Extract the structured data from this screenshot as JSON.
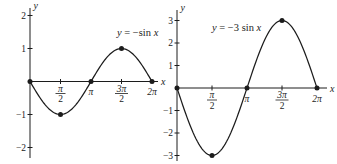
{
  "style": {
    "ink": "#1c1c1c",
    "background": "#ffffff"
  },
  "chart_data": [
    {
      "name": "left-graph",
      "type": "line",
      "title": "y = −sin x",
      "equation_label_segments": [
        {
          "text": "y",
          "italic": true
        },
        {
          "text": " = −sin ",
          "italic": false
        },
        {
          "text": "x",
          "italic": true
        }
      ],
      "amplitude": -1,
      "x_range_radians": [
        0,
        6.28319
      ],
      "ylim": [
        -2,
        2
      ],
      "xlabel": "x",
      "ylabel": "y",
      "grid": false,
      "y_ticks": [
        2,
        1,
        -1,
        -2
      ],
      "x_ticks": [
        {
          "x": 1.5708,
          "label": "π/2",
          "fraction": {
            "num": "π",
            "den": "2"
          },
          "tick_mark": true
        },
        {
          "x": 3.14159,
          "label": "π",
          "tick_mark": false
        },
        {
          "x": 4.71239,
          "label": "3π/2",
          "fraction": {
            "num": "3π",
            "den": "2"
          },
          "tick_mark": true
        },
        {
          "x": 6.28319,
          "label": "2π",
          "tick_mark": false
        }
      ],
      "marked_points": [
        [
          0,
          0
        ],
        [
          1.5708,
          -1
        ],
        [
          3.14159,
          0
        ],
        [
          4.71239,
          1
        ],
        [
          6.28319,
          0
        ]
      ],
      "px": {
        "origin": [
          30,
          81.5
        ],
        "half_pi_px": 30.5,
        "unit_y_px": 33,
        "y_axis_top": 8,
        "y_axis_bottom": 158,
        "x_axis_end": 158,
        "equation_label_pos": [
          117,
          35.5
        ]
      }
    },
    {
      "name": "right-graph",
      "type": "line",
      "title": "y = −3 sin x",
      "equation_label_segments": [
        {
          "text": "y",
          "italic": true
        },
        {
          "text": " = −3 sin ",
          "italic": false
        },
        {
          "text": "x",
          "italic": true
        }
      ],
      "amplitude": -3,
      "x_range_radians": [
        0,
        6.28319
      ],
      "ylim": [
        -3,
        3
      ],
      "xlabel": "x",
      "ylabel": "y",
      "grid": false,
      "y_ticks": [
        3,
        2,
        1,
        -1,
        -2,
        -3
      ],
      "x_ticks": [
        {
          "x": 1.5708,
          "label": "π/2",
          "fraction": {
            "num": "π",
            "den": "2"
          },
          "tick_mark": true
        },
        {
          "x": 3.14159,
          "label": "π",
          "tick_mark": false
        },
        {
          "x": 4.71239,
          "label": "3π/2",
          "fraction": {
            "num": "3π",
            "den": "2"
          },
          "tick_mark": true
        },
        {
          "x": 6.28319,
          "label": "2π",
          "tick_mark": false
        }
      ],
      "marked_points": [
        [
          0,
          0
        ],
        [
          1.5708,
          -3
        ],
        [
          3.14159,
          0
        ],
        [
          4.71239,
          3
        ],
        [
          6.28319,
          0
        ]
      ],
      "px": {
        "origin": [
          177,
          88
        ],
        "half_pi_px": 35,
        "unit_y_px": 22.5,
        "y_axis_top": 10,
        "y_axis_bottom": 161,
        "x_axis_end": 327,
        "equation_label_pos": [
          212,
          31
        ]
      }
    }
  ]
}
